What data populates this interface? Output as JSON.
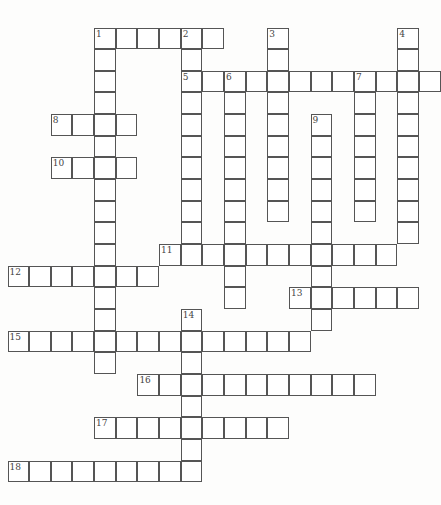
{
  "puzzle": {
    "type": "crossword",
    "origin": {
      "x": 8,
      "y": 28
    },
    "cell_size": 21.65,
    "entries": [
      {
        "number": "1",
        "direction": "across",
        "row": 0,
        "col": 4,
        "length": 6
      },
      {
        "number": "1",
        "direction": "down",
        "row": 0,
        "col": 4,
        "length": 16
      },
      {
        "number": "2",
        "direction": "down",
        "row": 0,
        "col": 8,
        "length": 11
      },
      {
        "number": "3",
        "direction": "down",
        "row": 0,
        "col": 12,
        "length": 9
      },
      {
        "number": "4",
        "direction": "down",
        "row": 0,
        "col": 18,
        "length": 10
      },
      {
        "number": "5",
        "direction": "across",
        "row": 2,
        "col": 8,
        "length": 12
      },
      {
        "number": "6",
        "direction": "down",
        "row": 2,
        "col": 10,
        "length": 11
      },
      {
        "number": "7",
        "direction": "down",
        "row": 2,
        "col": 16,
        "length": 7
      },
      {
        "number": "8",
        "direction": "across",
        "row": 4,
        "col": 2,
        "length": 4
      },
      {
        "number": "9",
        "direction": "down",
        "row": 4,
        "col": 14,
        "length": 10
      },
      {
        "number": "10",
        "direction": "across",
        "row": 6,
        "col": 2,
        "length": 4
      },
      {
        "number": "11",
        "direction": "across",
        "row": 10,
        "col": 7,
        "length": 11
      },
      {
        "number": "12",
        "direction": "across",
        "row": 11,
        "col": 0,
        "length": 7
      },
      {
        "number": "13",
        "direction": "across",
        "row": 12,
        "col": 13,
        "length": 6
      },
      {
        "number": "14",
        "direction": "down",
        "row": 13,
        "col": 8,
        "length": 8
      },
      {
        "number": "15",
        "direction": "across",
        "row": 14,
        "col": 0,
        "length": 14
      },
      {
        "number": "16",
        "direction": "across",
        "row": 16,
        "col": 6,
        "length": 11
      },
      {
        "number": "17",
        "direction": "across",
        "row": 18,
        "col": 4,
        "length": 9
      },
      {
        "number": "18",
        "direction": "across",
        "row": 20,
        "col": 0,
        "length": 9
      }
    ]
  }
}
